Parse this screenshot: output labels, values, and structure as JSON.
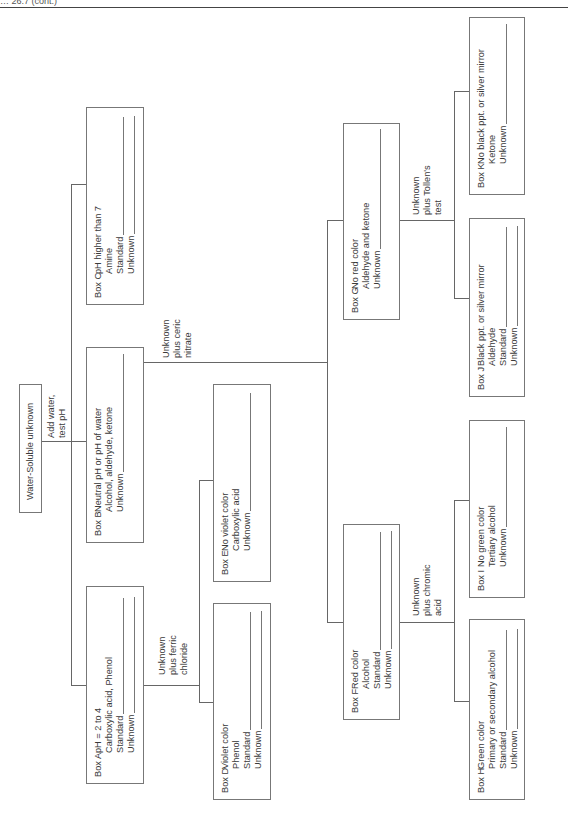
{
  "header": {
    "text": "… 26.7 (cont.)"
  },
  "root": {
    "label": "Water-Soluble unknown"
  },
  "edges": {
    "add_water": [
      "Add water,",
      "test pH"
    ],
    "ferric": [
      "Unknown",
      "plus ferric",
      "chloride"
    ],
    "ceric": [
      "Unknown",
      "plus ceric",
      "nitrate"
    ],
    "chromic": [
      "Unknown",
      "plus chromic",
      "acid"
    ],
    "tollens": [
      "Unknown",
      "plus Tollen's",
      "test"
    ]
  },
  "boxes": {
    "A": {
      "label": "Box A",
      "lines": [
        "pH = 2 to 4",
        "Carboxylic acid, Phenol",
        "Standard",
        "Unknown"
      ]
    },
    "B": {
      "label": "Box B",
      "lines": [
        "Neutral pH or pH of water",
        "Alcohol, aldehyde, ketone",
        "Unknown"
      ]
    },
    "C": {
      "label": "Box C",
      "lines": [
        "pH higher than 7",
        "Amine",
        "Standard",
        "Unknown"
      ]
    },
    "D": {
      "label": "Box D",
      "lines": [
        "Violet color",
        "Phenol",
        "Standard",
        "Unknown"
      ]
    },
    "E": {
      "label": "Box E",
      "lines": [
        "No violet color",
        "Carboxylic acid",
        "Unknown"
      ]
    },
    "F": {
      "label": "Box F",
      "lines": [
        "Red color",
        "Alcohol",
        "Standard",
        "Unknown"
      ]
    },
    "G": {
      "label": "Box G",
      "lines": [
        "No red color",
        "Aldehyde and ketone",
        "Unknown"
      ]
    },
    "H": {
      "label": "Box H",
      "lines": [
        "Green color",
        "Primary or secondary alcohol",
        "Standard",
        "Unknown"
      ]
    },
    "I": {
      "label": "Box I",
      "lines": [
        "No green color",
        "Tertiary alcohol",
        "Unknown"
      ]
    },
    "J": {
      "label": "Box J",
      "lines": [
        "Black ppt. or silver mirror",
        "Aldehyde",
        "Standard",
        "Unknown"
      ]
    },
    "K": {
      "label": "Box K",
      "lines": [
        "No black ppt. or silver mirror",
        "Ketone",
        "Unknown"
      ]
    }
  }
}
